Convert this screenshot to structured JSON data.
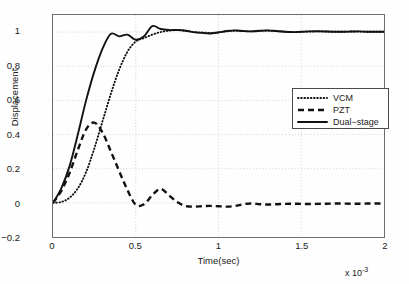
{
  "chart_data": {
    "type": "line",
    "title": "",
    "xlabel": "Time(sec)",
    "ylabel": "Displacement",
    "x_exponent_label": "x 10",
    "x_exponent_power": "-3",
    "xlim": [
      0,
      2
    ],
    "ylim": [
      -0.2,
      1.1
    ],
    "xticks": [
      "0",
      "0.5",
      "1",
      "1.5",
      "2"
    ],
    "xtick_values": [
      0,
      0.5,
      1,
      1.5,
      2
    ],
    "yticks": [
      "-0.2",
      "0",
      "0.2",
      "0.4",
      "0.6",
      "0.8",
      "1"
    ],
    "ytick_values": [
      -0.2,
      0,
      0.2,
      0.4,
      0.6,
      0.8,
      1
    ],
    "grid": true,
    "grid_style": "dotted",
    "grid_color": "#c8c8c8",
    "legend_position": "right-middle",
    "axis_color": "#6e6e6e",
    "series": [
      {
        "name": "VCM",
        "style": "dotted",
        "color": "#111111",
        "x": [
          0,
          0.05,
          0.1,
          0.15,
          0.2,
          0.25,
          0.3,
          0.35,
          0.4,
          0.45,
          0.5,
          0.55,
          0.6,
          0.65,
          0.7,
          0.75,
          0.8,
          0.85,
          0.9,
          0.95,
          1.0,
          1.05,
          1.1,
          1.15,
          1.2,
          1.25,
          1.3,
          1.35,
          1.4,
          1.45,
          1.5,
          1.55,
          1.6,
          1.65,
          1.7,
          1.75,
          1.8,
          1.85,
          1.9,
          1.95,
          2.0
        ],
        "values": [
          0.0,
          0.005,
          0.03,
          0.085,
          0.18,
          0.32,
          0.48,
          0.64,
          0.78,
          0.885,
          0.945,
          0.965,
          0.985,
          1.0,
          1.008,
          1.012,
          1.008,
          1.0,
          0.998,
          0.995,
          0.998,
          1.004,
          1.008,
          1.006,
          1.004,
          1.006,
          1.008,
          1.005,
          1.002,
          1.0,
          1.001,
          1.003,
          1.004,
          1.003,
          1.002,
          1.002,
          1.003,
          1.003,
          1.002,
          1.002,
          1.002
        ]
      },
      {
        "name": "PZT",
        "style": "dashed",
        "color": "#111111",
        "x": [
          0,
          0.05,
          0.1,
          0.15,
          0.2,
          0.25,
          0.3,
          0.35,
          0.4,
          0.45,
          0.5,
          0.55,
          0.6,
          0.65,
          0.7,
          0.75,
          0.8,
          0.85,
          0.9,
          0.95,
          1.0,
          1.05,
          1.1,
          1.15,
          1.2,
          1.25,
          1.3,
          1.35,
          1.4,
          1.45,
          1.5,
          1.55,
          1.6,
          1.65,
          1.7,
          1.75,
          1.8,
          1.85,
          1.9,
          1.95,
          2.0
        ],
        "values": [
          0.0,
          0.07,
          0.175,
          0.31,
          0.43,
          0.47,
          0.41,
          0.3,
          0.185,
          0.075,
          -0.012,
          -0.008,
          0.045,
          0.082,
          0.045,
          0.005,
          -0.018,
          -0.022,
          -0.02,
          -0.018,
          -0.02,
          -0.022,
          -0.018,
          -0.008,
          -0.004,
          -0.008,
          -0.01,
          -0.008,
          -0.006,
          -0.005,
          -0.006,
          -0.007,
          -0.006,
          -0.005,
          -0.004,
          -0.004,
          -0.005,
          -0.005,
          -0.004,
          -0.004,
          -0.004
        ]
      },
      {
        "name": "Dual-stage",
        "style": "solid",
        "color": "#111111",
        "x": [
          0,
          0.05,
          0.1,
          0.15,
          0.2,
          0.25,
          0.3,
          0.35,
          0.4,
          0.45,
          0.5,
          0.55,
          0.6,
          0.65,
          0.7,
          0.75,
          0.8,
          0.85,
          0.9,
          0.95,
          1.0,
          1.05,
          1.1,
          1.15,
          1.2,
          1.25,
          1.3,
          1.35,
          1.4,
          1.45,
          1.5,
          1.55,
          1.6,
          1.65,
          1.7,
          1.75,
          1.8,
          1.85,
          1.9,
          1.95,
          2.0
        ],
        "values": [
          0.0,
          0.085,
          0.215,
          0.4,
          0.6,
          0.77,
          0.905,
          0.99,
          0.975,
          0.985,
          0.955,
          0.975,
          1.035,
          1.018,
          1.012,
          1.012,
          1.008,
          1.0,
          0.995,
          0.992,
          0.998,
          1.006,
          1.01,
          1.006,
          1.004,
          1.008,
          1.01,
          1.006,
          1.002,
          1.0,
          1.002,
          1.004,
          1.005,
          1.003,
          1.002,
          1.002,
          1.003,
          1.004,
          1.002,
          1.002,
          1.002
        ]
      }
    ]
  }
}
